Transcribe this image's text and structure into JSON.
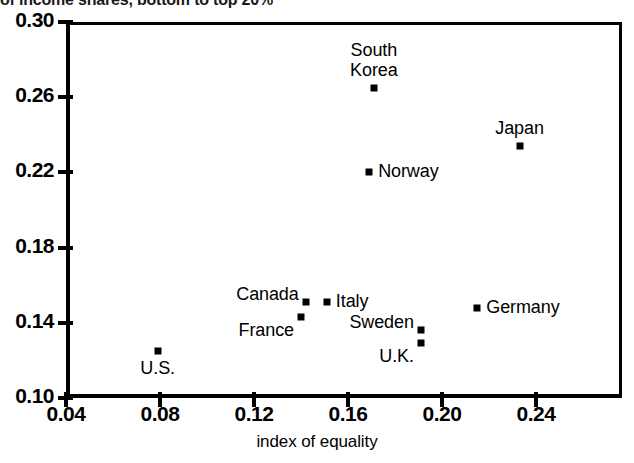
{
  "chart_data": {
    "type": "scatter",
    "title": "of income shares, bottom to top 20%",
    "xlabel": "index of equality",
    "ylabel": "",
    "xlim": [
      0.04,
      0.2466
    ],
    "ylim": [
      0.1,
      0.3
    ],
    "xticks": [
      "0.04",
      "0.08",
      "0.12",
      "0.16",
      "0.20",
      "0.24"
    ],
    "xtick_values": [
      0.04,
      0.08,
      0.12,
      0.16,
      0.2,
      0.24
    ],
    "yticks": [
      "0.30",
      "0.26",
      "0.22",
      "0.18",
      "0.14",
      "0.10"
    ],
    "ytick_values": [
      0.3,
      0.26,
      0.22,
      0.18,
      0.14,
      0.1
    ],
    "grid": false,
    "legend": "none",
    "marker": "square",
    "marker_color": "#000000",
    "points": [
      {
        "label": "South\nKorea",
        "x": 0.171,
        "y": 0.265,
        "label_pos": "above"
      },
      {
        "label": "Japan",
        "x": 0.233,
        "y": 0.234,
        "label_pos": "above"
      },
      {
        "label": "Norway",
        "x": 0.169,
        "y": 0.22,
        "label_pos": "right"
      },
      {
        "label": "Canada",
        "x": 0.142,
        "y": 0.151,
        "label_pos": "above-left"
      },
      {
        "label": "Italy",
        "x": 0.151,
        "y": 0.151,
        "label_pos": "right"
      },
      {
        "label": "France",
        "x": 0.14,
        "y": 0.143,
        "label_pos": "below-left"
      },
      {
        "label": "Germany",
        "x": 0.215,
        "y": 0.148,
        "label_pos": "right"
      },
      {
        "label": "Sweden",
        "x": 0.191,
        "y": 0.136,
        "label_pos": "above-left"
      },
      {
        "label": "U.K.",
        "x": 0.191,
        "y": 0.129,
        "label_pos": "below-left"
      },
      {
        "label": "U.S.",
        "x": 0.079,
        "y": 0.125,
        "label_pos": "below"
      }
    ]
  }
}
